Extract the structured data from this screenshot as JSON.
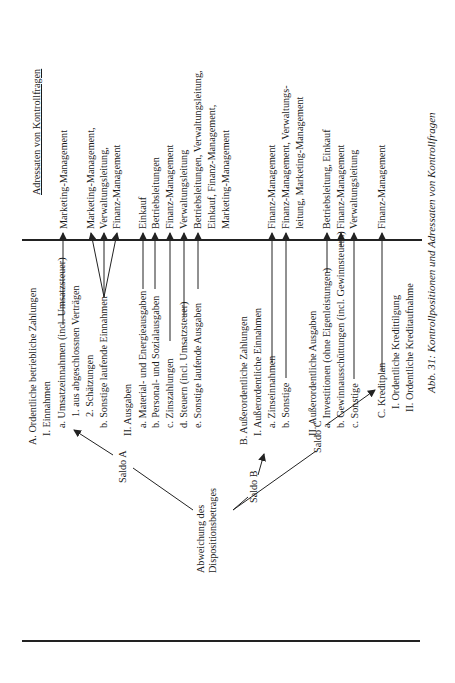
{
  "figure": {
    "caption": "Abb. 31: Kontrollpositionen und Adressaten von Kontrollfragen",
    "orientation": "rotated 90° counter-clockwise"
  },
  "root": {
    "line1": "Abweichung des",
    "line2": "Dispositionsbetrages"
  },
  "saldi": [
    {
      "label": "Saldo A"
    },
    {
      "label": "Saldo B"
    },
    {
      "label": "Saldo C"
    }
  ],
  "positions": {
    "A": {
      "title": "A. Ordentliche betriebliche Zahlungen",
      "I_title": "I. Einnahmen",
      "I_items": [
        "a. Umsatzeinnahmen (incl. Umsatzsteuer)",
        "1. aus abgeschlossnen Verträgen",
        "2. Schätzungen",
        "b. Sonstige laufende Einnahmen"
      ],
      "II_title": "II. Ausgaben",
      "II_items": [
        "a. Material- und Energieausgaben",
        "b. Personal- und Sozialausgaben",
        "c. Zinszahlungen",
        "d. Steuern (incl. Umsatzsteuer)",
        "e. Sonstige laufende Ausgaben"
      ]
    },
    "B": {
      "title": "B. Außerordentliche Zahlungen",
      "I_title": "I. Außerordentliche Einnahmen",
      "I_items": [
        "a. Zinseinnahmen",
        "b. Sonstige"
      ],
      "II_title": "II. Außerordentliche Ausgaben",
      "II_items": [
        "a. Investitionen (ohne Eigenleistungen)",
        "b. Gewinnausschüttungen (incl. Gewinnsteuern)",
        "c. Sonstige"
      ]
    },
    "C": {
      "title": "C. Kreditplan",
      "items": [
        "I. Ordentliche Kredittilgung",
        "II. Ordentliche Kreditaufnahme"
      ]
    }
  },
  "addressees": {
    "header": "Adressaten von Kontrollfragen",
    "rows": [
      [
        "Marketing-Management"
      ],
      [
        "Marketing-Management,",
        "Verwaltungsleitung,",
        "Finanz-Management"
      ],
      [
        "Einkauf"
      ],
      [
        "Betriebsleitungen"
      ],
      [
        "Finanz-Management"
      ],
      [
        "Verwaltungsleitung"
      ],
      [
        "Betriebsleitungen, Verwaltungsleitung,",
        "Einkauf, Finanz-Management,",
        "Marketing-Management"
      ],
      [
        "Finanz-Management"
      ],
      [
        "Finanz-Management, Verwaltungs-",
        "leitung, Marketing-Management"
      ],
      [
        "Betriebsleitung, Einkauf"
      ],
      [
        "Finanz-Management"
      ],
      [
        "Verwaltungsleitung"
      ],
      [
        "Finanz-Management"
      ]
    ]
  }
}
